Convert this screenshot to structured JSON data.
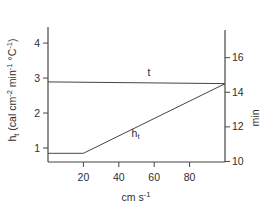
{
  "figure": {
    "background": "#ffffff",
    "line_color": "#454545",
    "text_color": "#2e2e2e"
  },
  "chart_data": {
    "type": "line",
    "title": "",
    "grid": false,
    "legend": "inline-labels",
    "x_axis": {
      "label": "cm s^-1^",
      "range": [
        0,
        100
      ],
      "ticks": [
        20,
        40,
        60,
        80
      ]
    },
    "y_left_axis": {
      "label": "h~t~ (cal cm^-2^ min^-1^ °C^-1^)",
      "range": [
        0.6,
        4.46
      ],
      "ticks": [
        1,
        2,
        3,
        4
      ]
    },
    "y_right_axis": {
      "label": "min",
      "range": [
        9.97,
        17.6
      ],
      "ticks": [
        10,
        12,
        14,
        16
      ]
    },
    "series": [
      {
        "name": "t",
        "label": "t",
        "axis": "right",
        "points": [
          [
            0,
            14.6
          ],
          [
            100,
            14.5
          ]
        ],
        "label_at": [
          57,
          15.17
        ]
      },
      {
        "name": "h_t",
        "label": "h~t~",
        "axis": "left",
        "points": [
          [
            0,
            0.85
          ],
          [
            20,
            0.85
          ],
          [
            100,
            2.84
          ]
        ],
        "label_at": [
          49.5,
          1.43
        ]
      }
    ]
  }
}
